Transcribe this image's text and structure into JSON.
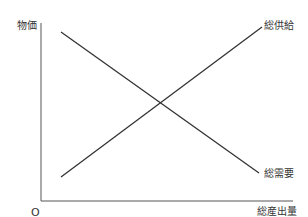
{
  "diagram": {
    "y_axis_label": "物価",
    "x_axis_label": "総産出量",
    "origin_label": "O",
    "curves": [
      {
        "name": "総供給",
        "slope": "upward"
      },
      {
        "name": "総需要",
        "slope": "downward"
      }
    ],
    "colors": {
      "line": "#333333",
      "axis": "#555555"
    }
  }
}
